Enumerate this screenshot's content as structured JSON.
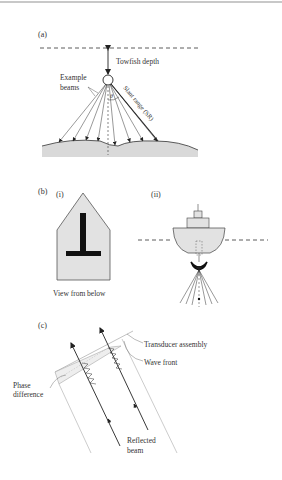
{
  "figure": {
    "panel_a": {
      "label": "(a)",
      "depth_label": "Towfish depth",
      "beams_label_line1": "Example",
      "beams_label_line2": "beams",
      "angle_label": "θ",
      "slant_label": "Slant range (SR)"
    },
    "panel_b": {
      "label": "(b)",
      "sub_i": "(i)",
      "sub_ii": "(ii)",
      "caption_i": "View from below"
    },
    "panel_c": {
      "label": "(c)",
      "transducer_label": "Transducer assembly",
      "wavefront_label": "Wave front",
      "phase_line1": "Phase",
      "phase_line2": "difference",
      "reflected_line1": "Reflected",
      "reflected_line2": "beam"
    }
  },
  "colors": {
    "ink": "#333333",
    "fill_gray": "#d9d9d9",
    "black": "#111111",
    "light_line": "#9a9a9a"
  }
}
